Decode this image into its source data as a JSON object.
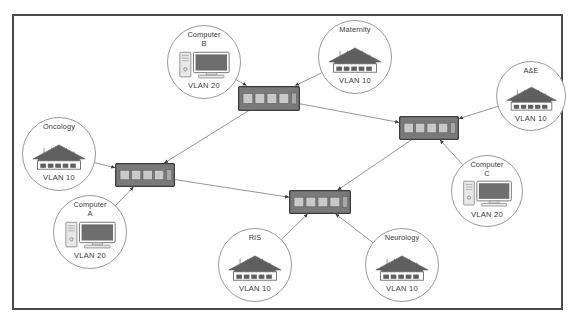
{
  "diagram": {
    "type": "network-diagram",
    "frame": {
      "border_color": "#4a4a4a",
      "background": "#ffffff"
    },
    "colors": {
      "switch_body": "#7a7a7a",
      "switch_border": "#3c3c3c",
      "building_roof": "#5f5f5f",
      "building_base": "#ffffff",
      "computer_screen": "#6e6e6e",
      "computer_tower": "#e8e8e8",
      "circle_border": "#9a9a9a",
      "link": "#8a8a8a",
      "text": "#3a3a3a"
    },
    "nodes": [
      {
        "id": "computer-b",
        "kind": "computer",
        "label": "Computer\nB",
        "vlan": "VLAN 20",
        "cx": 204,
        "cy": 62,
        "r": 37
      },
      {
        "id": "maternity",
        "kind": "building",
        "label": "Maternity",
        "vlan": "VLAN 10",
        "cx": 355,
        "cy": 57,
        "r": 37
      },
      {
        "id": "ae",
        "kind": "building",
        "label": "A&E",
        "vlan": "VLAN 10",
        "cx": 531,
        "cy": 96,
        "r": 35
      },
      {
        "id": "oncology",
        "kind": "building",
        "label": "Oncology",
        "vlan": "VLAN 10",
        "cx": 59,
        "cy": 154,
        "r": 37
      },
      {
        "id": "computer-a",
        "kind": "computer",
        "label": "Computer\nA",
        "vlan": "VLAN 20",
        "cx": 90,
        "cy": 232,
        "r": 37
      },
      {
        "id": "computer-c",
        "kind": "computer",
        "label": "Computer\nC",
        "vlan": "VLAN 20",
        "cx": 487,
        "cy": 191,
        "r": 36
      },
      {
        "id": "ris",
        "kind": "building",
        "label": "RIS",
        "vlan": "VLAN 10",
        "cx": 255,
        "cy": 265,
        "r": 37
      },
      {
        "id": "neurology",
        "kind": "building",
        "label": "Neurology",
        "vlan": "VLAN 10",
        "cx": 402,
        "cy": 265,
        "r": 37
      }
    ],
    "switches": [
      {
        "id": "switch-top",
        "cx": 269,
        "cy": 98,
        "w": 62,
        "h": 25
      },
      {
        "id": "switch-left",
        "cx": 145,
        "cy": 175,
        "w": 60,
        "h": 24
      },
      {
        "id": "switch-bottom",
        "cx": 320,
        "cy": 202,
        "w": 62,
        "h": 24
      },
      {
        "id": "switch-right",
        "cx": 429,
        "cy": 128,
        "w": 60,
        "h": 24
      }
    ],
    "links": [
      {
        "from": "computer-b",
        "to": "switch-top"
      },
      {
        "from": "maternity",
        "to": "switch-top"
      },
      {
        "from": "switch-top",
        "to": "switch-right"
      },
      {
        "from": "switch-top",
        "to": "switch-left"
      },
      {
        "from": "oncology",
        "to": "switch-left"
      },
      {
        "from": "computer-a",
        "to": "switch-left"
      },
      {
        "from": "switch-left",
        "to": "switch-bottom"
      },
      {
        "from": "ae",
        "to": "switch-right"
      },
      {
        "from": "computer-c",
        "to": "switch-right"
      },
      {
        "from": "switch-right",
        "to": "switch-bottom"
      },
      {
        "from": "ris",
        "to": "switch-bottom"
      },
      {
        "from": "neurology",
        "to": "switch-bottom"
      }
    ]
  }
}
